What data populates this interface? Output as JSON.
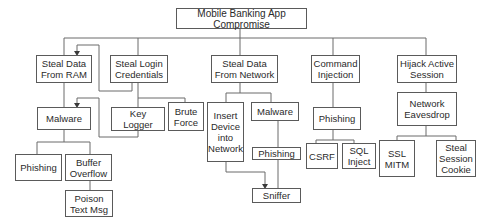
{
  "diagram": {
    "type": "attack-tree",
    "root": "Mobile Banking App Compromise",
    "nodes": {
      "root": "Mobile Banking App Compromise",
      "steal_ram": "Steal Data\nFrom RAM",
      "steal_login": "Steal Login\nCredentials",
      "steal_network": "Steal Data\nFrom Network",
      "command_injection": "Command\nInjection",
      "hijack_session": "Hijack Active\nSession",
      "malware_ram": "Malware",
      "key_logger": "Key Logger",
      "brute_force": "Brute\nForce",
      "insert_device": "Insert\nDevice\ninto\nNetwork",
      "malware_network": "Malware",
      "phishing_network": "Phishing",
      "sniffer": "Sniffer",
      "phishing_injection": "Phishing",
      "csrf": "CSRF",
      "sql_inject": "SQL\nInject",
      "network_eavesdrop": "Network\nEavesdrop",
      "ssl_mitm": "SSL\nMITM",
      "steal_cookie": "Steal\nSession\nCookie",
      "phishing_ram": "Phishing",
      "buffer_overflow": "Buffer\nOverflow",
      "poison_text": "Poison\nText Msg"
    },
    "edges": [
      [
        "root",
        "steal_ram"
      ],
      [
        "root",
        "steal_login"
      ],
      [
        "root",
        "steal_network"
      ],
      [
        "root",
        "command_injection"
      ],
      [
        "root",
        "hijack_session"
      ],
      [
        "steal_ram",
        "malware_ram"
      ],
      [
        "steal_login",
        "key_logger"
      ],
      [
        "steal_login",
        "brute_force"
      ],
      [
        "steal_network",
        "insert_device"
      ],
      [
        "steal_network",
        "malware_network"
      ],
      [
        "malware_network",
        "phishing_network"
      ],
      [
        "phishing_network",
        "sniffer"
      ],
      [
        "command_injection",
        "phishing_injection"
      ],
      [
        "phishing_injection",
        "csrf"
      ],
      [
        "phishing_injection",
        "sql_inject"
      ],
      [
        "hijack_session",
        "network_eavesdrop"
      ],
      [
        "network_eavesdrop",
        "ssl_mitm"
      ],
      [
        "network_eavesdrop",
        "steal_cookie"
      ],
      [
        "malware_ram",
        "phishing_ram"
      ],
      [
        "malware_ram",
        "buffer_overflow"
      ],
      [
        "buffer_overflow",
        "poison_text"
      ]
    ],
    "arrows": [
      [
        "steal_login",
        "steal_ram"
      ],
      [
        "key_logger",
        "malware_ram"
      ],
      [
        "insert_device",
        "sniffer"
      ]
    ]
  }
}
